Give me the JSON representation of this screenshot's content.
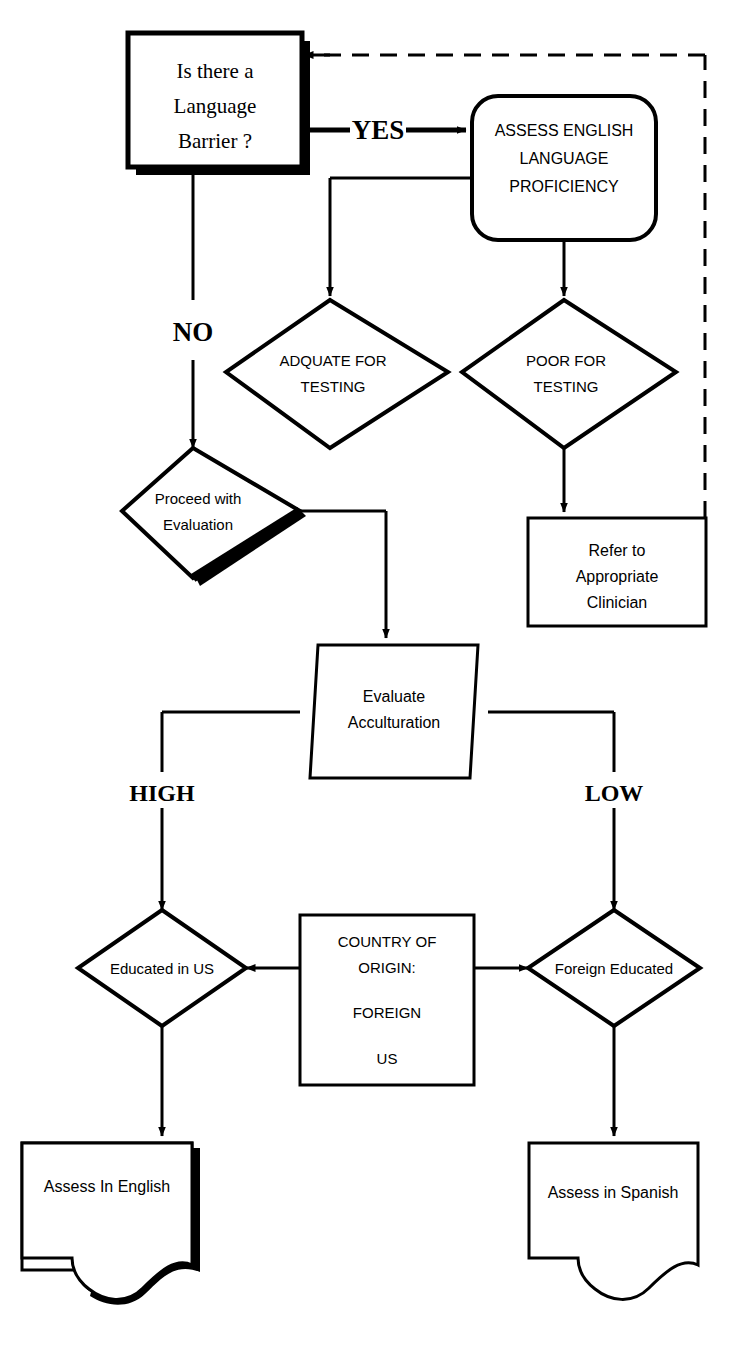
{
  "diagram": {
    "type": "flowchart",
    "colors": {
      "ink": "#000000",
      "paper": "#ffffff"
    },
    "nodes": {
      "language_barrier": {
        "shape": "rect-shadow",
        "line1": "Is there a",
        "line2": "Language",
        "line3": "Barrier ?"
      },
      "assess_english": {
        "shape": "rounded-rect",
        "line1": "ASSESS ENGLISH",
        "line2": "LANGUAGE",
        "line3": "PROFICIENCY"
      },
      "adquate_testing": {
        "shape": "diamond",
        "line1": "ADQUATE FOR",
        "line2": "TESTING"
      },
      "poor_testing": {
        "shape": "diamond",
        "line1": "POOR FOR",
        "line2": "TESTING"
      },
      "proceed_evaluation": {
        "shape": "diamond-shadow",
        "line1": "Proceed with",
        "line2": "Evaluation"
      },
      "refer_clinician": {
        "shape": "rect",
        "line1": "Refer to",
        "line2": "Appropriate",
        "line3": "Clinician"
      },
      "evaluate_acculturation": {
        "shape": "parallelogram",
        "line1": "Evaluate",
        "line2": "Acculturation"
      },
      "country_of_origin": {
        "shape": "rect",
        "line1": "COUNTRY OF",
        "line2": "ORIGIN:",
        "line3": "FOREIGN",
        "line4": "US"
      },
      "educated_in_us": {
        "shape": "diamond",
        "line1": "Educated in US"
      },
      "foreign_educated": {
        "shape": "diamond",
        "line1": "Foreign Educated"
      },
      "assess_in_english": {
        "shape": "document-shadow",
        "line1": "Assess In English"
      },
      "assess_in_spanish": {
        "shape": "document",
        "line1": "Assess in Spanish"
      }
    },
    "edge_labels": {
      "yes": "YES",
      "no": "NO",
      "high": "HIGH",
      "low": "LOW"
    }
  }
}
